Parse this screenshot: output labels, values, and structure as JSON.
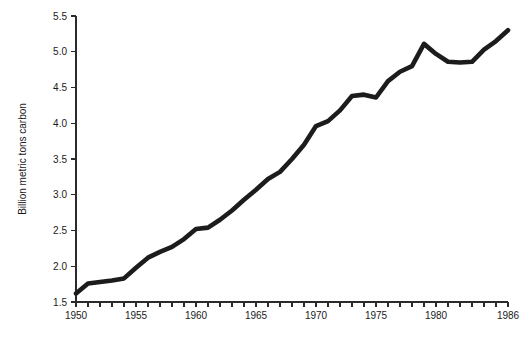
{
  "chart_data": {
    "type": "line",
    "title": "",
    "subtitle": "",
    "xlabel": "",
    "ylabel": "Billion metric tons carbon",
    "xlim": [
      1950,
      1986
    ],
    "ylim": [
      1.5,
      5.5
    ],
    "grid": false,
    "legend": "none",
    "x_tick_interval": 1,
    "x_label_interval": 5,
    "y_tick_interval": 0.5,
    "x_tick_labels": [
      "1950",
      "1955",
      "1960",
      "1965",
      "1970",
      "1975",
      "1980",
      "1986"
    ],
    "x_tick_label_years": [
      1950,
      1955,
      1960,
      1965,
      1970,
      1975,
      1980,
      1986
    ],
    "y_tick_labels": [
      "1.5",
      "2.0",
      "2.5",
      "3.0",
      "3.5",
      "4.0",
      "4.5",
      "5.0",
      "5.5"
    ],
    "y_tick_values": [
      1.5,
      2.0,
      2.5,
      3.0,
      3.5,
      4.0,
      4.5,
      5.0,
      5.5
    ],
    "series": [
      {
        "name": "Global carbon emissions",
        "color": "#1c1c1c",
        "x": [
          1950,
          1951,
          1952,
          1953,
          1954,
          1955,
          1956,
          1957,
          1958,
          1959,
          1960,
          1961,
          1962,
          1963,
          1964,
          1965,
          1966,
          1967,
          1968,
          1969,
          1970,
          1971,
          1972,
          1973,
          1974,
          1975,
          1976,
          1977,
          1978,
          1979,
          1980,
          1981,
          1982,
          1983,
          1984,
          1985,
          1986
        ],
        "values": [
          1.62,
          1.76,
          1.78,
          1.8,
          1.83,
          1.98,
          2.12,
          2.2,
          2.27,
          2.38,
          2.52,
          2.54,
          2.65,
          2.78,
          2.93,
          3.07,
          3.22,
          3.32,
          3.5,
          3.7,
          3.96,
          4.03,
          4.18,
          4.38,
          4.4,
          4.36,
          4.59,
          4.72,
          4.8,
          5.11,
          4.97,
          4.86,
          4.85,
          4.86,
          5.03,
          5.15,
          5.3
        ]
      }
    ]
  },
  "axis_titles": {
    "y": "Billion metric tons carbon"
  }
}
